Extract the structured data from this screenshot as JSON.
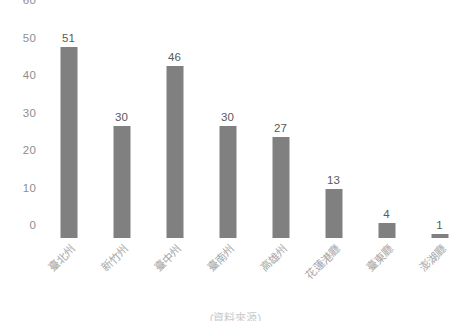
{
  "chart_data": {
    "type": "bar",
    "title": "",
    "subtitle": "",
    "xlabel": "",
    "ylabel": "",
    "categories": [
      "臺北州",
      "新竹州",
      "臺中州",
      "臺南州",
      "高雄州",
      "花蓮港廳",
      "臺東廳",
      "澎湖廳"
    ],
    "values": [
      51,
      30,
      46,
      30,
      27,
      13,
      4,
      1
    ],
    "series": [
      {
        "name": "",
        "values": [
          51,
          30,
          46,
          30,
          27,
          13,
          4,
          1
        ]
      }
    ],
    "ylim": [
      0,
      60
    ],
    "yticks": [
      0,
      10,
      20,
      30,
      40,
      50,
      60
    ],
    "ytick_labels": [
      "0",
      "10",
      "20",
      "30",
      "40",
      "50",
      "60"
    ],
    "grid": false,
    "legend": "none",
    "bar_color": "#808080",
    "value_label_color": "#595959",
    "axis_label_color": "#8e8e8e",
    "category_label_color": "#a6a6a6",
    "background": "#ffffff",
    "data_labels_shown": true
  },
  "footer": {
    "caption": "(資料來源)"
  }
}
